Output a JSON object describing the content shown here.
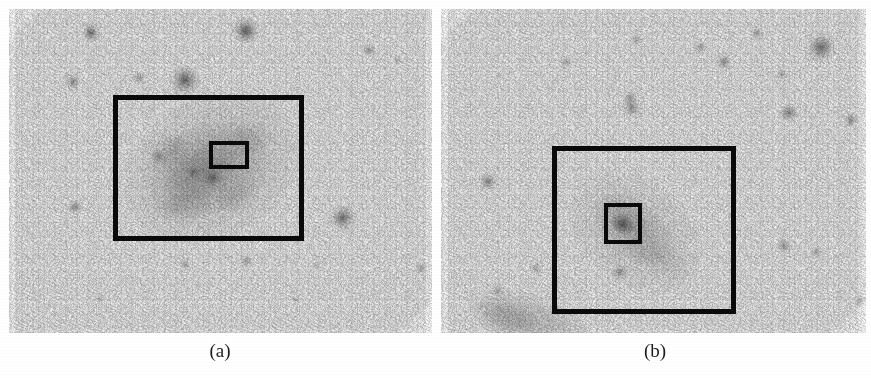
{
  "figure": {
    "background_color": "#ffffff",
    "sky_background_color": "#fbfbfb",
    "annotation_color": "#0a0a0a",
    "panels": [
      {
        "id": "a",
        "caption": "(a)",
        "caption_x": 220,
        "caption_y": 340,
        "frame": {
          "x": 9,
          "y": 9,
          "width": 423,
          "height": 324
        },
        "object_description": "irregular elongated galaxy, diffuse, tilted lower-left to upper-right",
        "galaxy_glow": [
          {
            "cx": 212,
            "cy": 168,
            "rx": 92,
            "ry": 70,
            "rot": -28,
            "strength": 0.3,
            "color": "#8f8f8f"
          },
          {
            "cx": 208,
            "cy": 170,
            "rx": 62,
            "ry": 44,
            "rot": -28,
            "strength": 0.26,
            "color": "#7d7d7d"
          },
          {
            "cx": 200,
            "cy": 172,
            "rx": 38,
            "ry": 26,
            "rot": -30,
            "strength": 0.24,
            "color": "#6e6e6e"
          },
          {
            "cx": 168,
            "cy": 152,
            "rx": 22,
            "ry": 15,
            "rot": -35,
            "strength": 0.22,
            "color": "#6a6a6a"
          },
          {
            "cx": 246,
            "cy": 140,
            "rx": 26,
            "ry": 17,
            "rot": -25,
            "strength": 0.17,
            "color": "#767676"
          },
          {
            "cx": 182,
            "cy": 205,
            "rx": 30,
            "ry": 16,
            "rot": -12,
            "strength": 0.18,
            "color": "#727272"
          },
          {
            "cx": 236,
            "cy": 196,
            "rx": 24,
            "ry": 14,
            "rot": -20,
            "strength": 0.15,
            "color": "#7a7a7a"
          }
        ],
        "boxes": [
          {
            "name": "outer-box",
            "x": 113,
            "y": 95,
            "width": 191,
            "height": 146,
            "border": 5
          },
          {
            "name": "inner-box",
            "x": 209,
            "y": 141,
            "width": 40,
            "height": 28,
            "border": 4
          }
        ],
        "stars": [
          {
            "x": 91,
            "y": 33,
            "r": 6,
            "i": 0.6
          },
          {
            "x": 246,
            "y": 31,
            "r": 8,
            "i": 0.72
          },
          {
            "x": 185,
            "y": 80,
            "r": 9,
            "i": 0.66
          },
          {
            "x": 73,
            "y": 82,
            "r": 5,
            "i": 0.46
          },
          {
            "x": 139,
            "y": 78,
            "r": 4,
            "i": 0.38
          },
          {
            "x": 369,
            "y": 50,
            "r": 4,
            "i": 0.42
          },
          {
            "x": 398,
            "y": 60,
            "r": 3,
            "i": 0.3
          },
          {
            "x": 343,
            "y": 218,
            "r": 8,
            "i": 0.62
          },
          {
            "x": 75,
            "y": 207,
            "r": 5,
            "i": 0.44
          },
          {
            "x": 421,
            "y": 268,
            "r": 4,
            "i": 0.34
          },
          {
            "x": 246,
            "y": 261,
            "r": 4,
            "i": 0.34
          },
          {
            "x": 185,
            "y": 265,
            "r": 4,
            "i": 0.3
          },
          {
            "x": 316,
            "y": 266,
            "r": 3,
            "i": 0.26
          },
          {
            "x": 193,
            "y": 172,
            "r": 4,
            "i": 0.4
          },
          {
            "x": 213,
            "y": 178,
            "r": 5,
            "i": 0.5
          },
          {
            "x": 158,
            "y": 156,
            "r": 4,
            "i": 0.34
          },
          {
            "x": 100,
            "y": 299,
            "r": 3,
            "i": 0.24
          },
          {
            "x": 296,
            "y": 300,
            "r": 3,
            "i": 0.22
          }
        ]
      },
      {
        "id": "b",
        "caption": "(b)",
        "caption_x": 655,
        "caption_y": 340,
        "frame": {
          "x": 441,
          "y": 9,
          "width": 425,
          "height": 324
        },
        "object_description": "diffuse elongated low-surface-brightness galaxy, upper-left to lower-right",
        "galaxy_glow": [
          {
            "cx": 635,
            "cy": 232,
            "rx": 74,
            "ry": 52,
            "rot": 38,
            "strength": 0.22,
            "color": "#8c8c8c"
          },
          {
            "cx": 632,
            "cy": 228,
            "rx": 46,
            "ry": 28,
            "rot": 38,
            "strength": 0.22,
            "color": "#7c7c7c"
          },
          {
            "cx": 627,
            "cy": 220,
            "rx": 26,
            "ry": 15,
            "rot": 40,
            "strength": 0.2,
            "color": "#6f6f6f"
          },
          {
            "cx": 622,
            "cy": 224,
            "rx": 13,
            "ry": 10,
            "rot": 35,
            "strength": 0.26,
            "color": "#5d5d5d"
          },
          {
            "cx": 660,
            "cy": 258,
            "rx": 34,
            "ry": 17,
            "rot": 30,
            "strength": 0.14,
            "color": "#858585"
          },
          {
            "cx": 530,
            "cy": 322,
            "rx": 62,
            "ry": 27,
            "rot": 18,
            "strength": 0.28,
            "color": "#7a7a7a"
          },
          {
            "cx": 506,
            "cy": 316,
            "rx": 30,
            "ry": 16,
            "rot": 20,
            "strength": 0.22,
            "color": "#6f6f6f"
          }
        ],
        "boxes": [
          {
            "name": "outer-box",
            "x": 552,
            "y": 146,
            "width": 184,
            "height": 168,
            "border": 5
          },
          {
            "name": "inner-box",
            "x": 604,
            "y": 203,
            "width": 38,
            "height": 41,
            "border": 4
          }
        ],
        "stars": [
          {
            "x": 821,
            "y": 47,
            "r": 9,
            "i": 0.6
          },
          {
            "x": 757,
            "y": 33,
            "r": 4,
            "i": 0.36
          },
          {
            "x": 724,
            "y": 62,
            "r": 5,
            "i": 0.44
          },
          {
            "x": 700,
            "y": 47,
            "r": 4,
            "i": 0.34
          },
          {
            "x": 781,
            "y": 74,
            "r": 4,
            "i": 0.32
          },
          {
            "x": 789,
            "y": 113,
            "r": 6,
            "i": 0.5
          },
          {
            "x": 851,
            "y": 120,
            "r": 5,
            "i": 0.42
          },
          {
            "x": 632,
            "y": 108,
            "r": 6,
            "i": 0.44
          },
          {
            "x": 630,
            "y": 98,
            "r": 5,
            "i": 0.36
          },
          {
            "x": 488,
            "y": 182,
            "r": 6,
            "i": 0.46
          },
          {
            "x": 536,
            "y": 268,
            "r": 4,
            "i": 0.32
          },
          {
            "x": 620,
            "y": 272,
            "r": 5,
            "i": 0.42
          },
          {
            "x": 784,
            "y": 246,
            "r": 5,
            "i": 0.4
          },
          {
            "x": 816,
            "y": 252,
            "r": 4,
            "i": 0.3
          },
          {
            "x": 498,
            "y": 290,
            "r": 4,
            "i": 0.3
          },
          {
            "x": 623,
            "y": 225,
            "r": 6,
            "i": 0.48
          },
          {
            "x": 566,
            "y": 62,
            "r": 4,
            "i": 0.3
          },
          {
            "x": 636,
            "y": 40,
            "r": 4,
            "i": 0.28
          },
          {
            "x": 860,
            "y": 300,
            "r": 4,
            "i": 0.26
          }
        ]
      }
    ]
  }
}
